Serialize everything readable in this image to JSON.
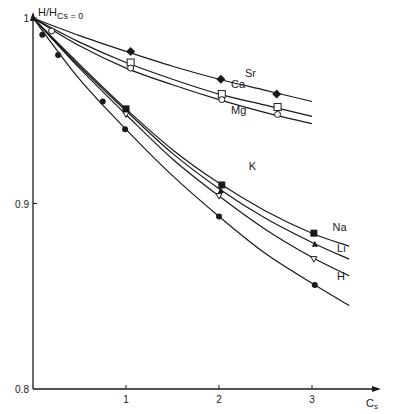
{
  "chart_data": {
    "type": "line",
    "title": "",
    "ylabel": "H/H_Cs=0",
    "ylabel_main": "H/H",
    "ylabel_sub": "Cs = 0",
    "xlabel": "C",
    "xlabel_sub": "s",
    "xlim": [
      0,
      3.5
    ],
    "ylim": [
      0.8,
      1.0
    ],
    "x_ticks": [
      1,
      2,
      3
    ],
    "x_tick_labels": [
      "1",
      "2",
      "3"
    ],
    "y_ticks": [
      0.8,
      0.9,
      1.0
    ],
    "y_tick_labels": [
      "0.8",
      "0.9",
      "1"
    ],
    "grid": false,
    "legend": "inline labels at curve ends",
    "series": [
      {
        "name": "Sr",
        "marker": "filled-diamond",
        "curve_end": 3.0,
        "points": [
          [
            0,
            1.0
          ],
          [
            1.05,
            0.982
          ],
          [
            2.02,
            0.967
          ],
          [
            2.62,
            0.959
          ]
        ],
        "curve": [
          [
            0,
            1.0
          ],
          [
            0.5,
            0.9905
          ],
          [
            1.0,
            0.982
          ],
          [
            1.5,
            0.974
          ],
          [
            2.0,
            0.967
          ],
          [
            2.5,
            0.961
          ],
          [
            3.0,
            0.955
          ]
        ]
      },
      {
        "name": "Ca",
        "marker": "open-square",
        "curve_end": 3.0,
        "points": [
          [
            0,
            1.0
          ],
          [
            1.05,
            0.976
          ],
          [
            2.03,
            0.959
          ],
          [
            2.63,
            0.952
          ]
        ],
        "curve": [
          [
            0,
            1.0
          ],
          [
            0.5,
            0.987
          ],
          [
            1.0,
            0.976
          ],
          [
            1.5,
            0.967
          ],
          [
            2.0,
            0.959
          ],
          [
            2.5,
            0.953
          ],
          [
            3.0,
            0.947
          ]
        ]
      },
      {
        "name": "Mg",
        "marker": "open-circle",
        "curve_end": 3.0,
        "points": [
          [
            0,
            1.0
          ],
          [
            0.2,
            0.993
          ],
          [
            1.05,
            0.973
          ],
          [
            2.03,
            0.956
          ],
          [
            2.63,
            0.948
          ]
        ],
        "curve": [
          [
            0,
            1.0
          ],
          [
            0.5,
            0.985
          ],
          [
            1.0,
            0.973
          ],
          [
            1.5,
            0.964
          ],
          [
            2.0,
            0.956
          ],
          [
            2.5,
            0.949
          ],
          [
            3.0,
            0.943
          ]
        ]
      },
      {
        "name": "K",
        "marker": "filled-square",
        "curve_end": 3.4,
        "points": [
          [
            0,
            1.0
          ],
          [
            1.0,
            0.951
          ],
          [
            2.03,
            0.91
          ],
          [
            3.02,
            0.884
          ]
        ],
        "curve": [
          [
            0,
            1.0
          ],
          [
            0.5,
            0.975
          ],
          [
            1.0,
            0.951
          ],
          [
            1.5,
            0.929
          ],
          [
            2.0,
            0.911
          ],
          [
            2.5,
            0.896
          ],
          [
            3.0,
            0.884
          ],
          [
            3.4,
            0.877
          ]
        ]
      },
      {
        "name": "Na",
        "marker": "filled-triangle",
        "curve_end": 3.4,
        "points": [
          [
            0,
            1.0
          ],
          [
            1.0,
            0.95
          ],
          [
            2.02,
            0.907
          ],
          [
            3.03,
            0.878
          ]
        ],
        "curve": [
          [
            0,
            1.0
          ],
          [
            0.5,
            0.974
          ],
          [
            1.0,
            0.95
          ],
          [
            1.5,
            0.927
          ],
          [
            2.0,
            0.908
          ],
          [
            2.5,
            0.892
          ],
          [
            3.0,
            0.879
          ],
          [
            3.4,
            0.87
          ]
        ]
      },
      {
        "name": "Li",
        "marker": "open-triangle-down",
        "curve_end": 3.4,
        "points": [
          [
            0,
            1.0
          ],
          [
            1.0,
            0.948
          ],
          [
            2.0,
            0.904
          ],
          [
            3.02,
            0.87
          ]
        ],
        "curve": [
          [
            0,
            1.0
          ],
          [
            0.5,
            0.973
          ],
          [
            1.0,
            0.948
          ],
          [
            1.5,
            0.924
          ],
          [
            2.0,
            0.904
          ],
          [
            2.5,
            0.886
          ],
          [
            3.0,
            0.871
          ],
          [
            3.4,
            0.861
          ]
        ]
      },
      {
        "name": "H",
        "marker": "filled-circle",
        "curve_end": 3.4,
        "points": [
          [
            0,
            1.0
          ],
          [
            0.1,
            0.991
          ],
          [
            0.27,
            0.98
          ],
          [
            0.75,
            0.955
          ],
          [
            0.99,
            0.94
          ],
          [
            2.0,
            0.893
          ],
          [
            3.03,
            0.856
          ]
        ],
        "curve": [
          [
            0,
            1.0
          ],
          [
            0.5,
            0.967
          ],
          [
            1.0,
            0.94
          ],
          [
            1.5,
            0.915
          ],
          [
            2.0,
            0.893
          ],
          [
            2.5,
            0.873
          ],
          [
            3.0,
            0.857
          ],
          [
            3.4,
            0.845
          ]
        ]
      }
    ]
  },
  "layout": {
    "x0_px": 33,
    "px_per_x": 93,
    "y_top_px": 18,
    "y_bottom_px": 389,
    "axis_end_px": 380,
    "line_color": "#1a1a1a"
  }
}
